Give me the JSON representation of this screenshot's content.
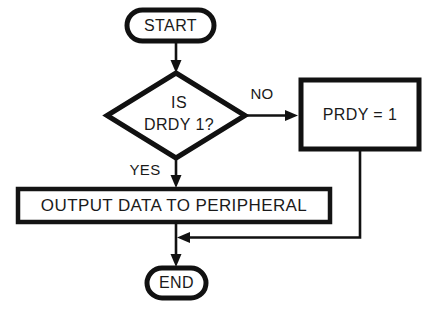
{
  "diagram": {
    "type": "flowchart",
    "background_color": "#ffffff",
    "line_color": "#111111",
    "text_color": "#1a1a1a",
    "nodes": {
      "start": {
        "shape": "terminator",
        "label": "START"
      },
      "decision": {
        "shape": "diamond",
        "label_line1": "IS",
        "label_line2": "DRDY 1?"
      },
      "prdy": {
        "shape": "process",
        "label": "PRDY = 1"
      },
      "output": {
        "shape": "process",
        "label": "OUTPUT DATA TO PERIPHERAL"
      },
      "end": {
        "shape": "terminator",
        "label": "END"
      }
    },
    "edges": {
      "no_branch": {
        "label": "NO"
      },
      "yes_branch": {
        "label": "YES"
      }
    }
  }
}
